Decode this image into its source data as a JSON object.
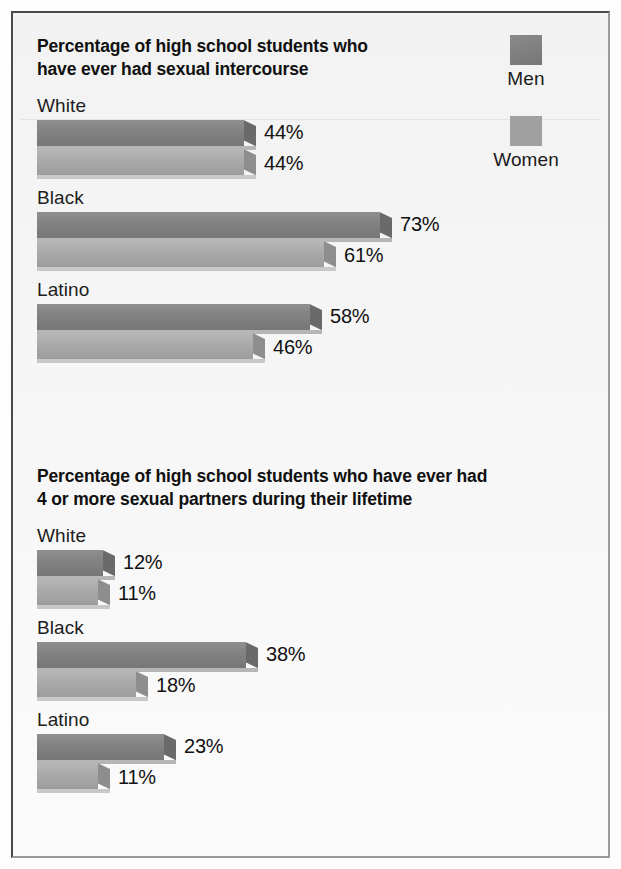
{
  "legend": {
    "items": [
      {
        "label": "Men",
        "color": "#7d7d7d",
        "swatch_name": "legend-swatch-men"
      },
      {
        "label": "Women",
        "color": "#a3a3a3",
        "swatch_name": "legend-swatch-women"
      }
    ]
  },
  "charts": [
    {
      "id": "chart1",
      "title": "Percentage of high school students who have ever had sexual intercourse",
      "title_line1": "Percentage of high school students who",
      "title_line2": "have ever had sexual intercourse",
      "groups": [
        {
          "label": "White",
          "men": "44%",
          "women": "44%",
          "men_value": 44,
          "women_value": 44
        },
        {
          "label": "Black",
          "men": "73%",
          "women": "61%",
          "men_value": 73,
          "women_value": 61
        },
        {
          "label": "Latino",
          "men": "58%",
          "women": "46%",
          "men_value": 58,
          "women_value": 46
        }
      ]
    },
    {
      "id": "chart2",
      "title": "Percentage of high school students who have ever had 4 or more sexual partners during their lifetime",
      "title_line1": "Percentage of high school students who have ever had",
      "title_line2": "4 or more sexual partners during their lifetime",
      "groups": [
        {
          "label": "White",
          "men": "12%",
          "women": "11%",
          "men_value": 12,
          "women_value": 11
        },
        {
          "label": "Black",
          "men": "38%",
          "women": "18%",
          "men_value": 38,
          "women_value": 18
        },
        {
          "label": "Latino",
          "men": "23%",
          "women": "11%",
          "men_value": 23,
          "women_value": 11
        }
      ]
    }
  ],
  "chart_data": [
    {
      "type": "bar",
      "title": "Percentage of high school students who have ever had sexual intercourse",
      "orientation": "horizontal",
      "categories": [
        "White",
        "Black",
        "Latino"
      ],
      "series": [
        {
          "name": "Men",
          "values": [
            44,
            73,
            58
          ]
        },
        {
          "name": "Women",
          "values": [
            44,
            61,
            46
          ]
        }
      ],
      "value_labels": [
        [
          "44%",
          "44%"
        ],
        [
          "73%",
          "61%"
        ],
        [
          "58%",
          "46%"
        ]
      ],
      "unit": "%",
      "xlabel": "",
      "ylabel": "",
      "xlim": [
        0,
        80
      ],
      "grid": false,
      "legend_position": "top-right",
      "pixels_per_percent": 4.7
    },
    {
      "type": "bar",
      "title": "Percentage of high school students who have ever had 4 or more sexual partners during their lifetime",
      "orientation": "horizontal",
      "categories": [
        "White",
        "Black",
        "Latino"
      ],
      "series": [
        {
          "name": "Men",
          "values": [
            12,
            38,
            23
          ]
        },
        {
          "name": "Women",
          "values": [
            11,
            18,
            11
          ]
        }
      ],
      "value_labels": [
        [
          "12%",
          "11%"
        ],
        [
          "38%",
          "18%"
        ],
        [
          "23%",
          "11%"
        ]
      ],
      "unit": "%",
      "xlabel": "",
      "ylabel": "",
      "xlim": [
        0,
        40
      ],
      "grid": false,
      "legend_position": "top-right",
      "pixels_per_percent": 5.5
    }
  ]
}
